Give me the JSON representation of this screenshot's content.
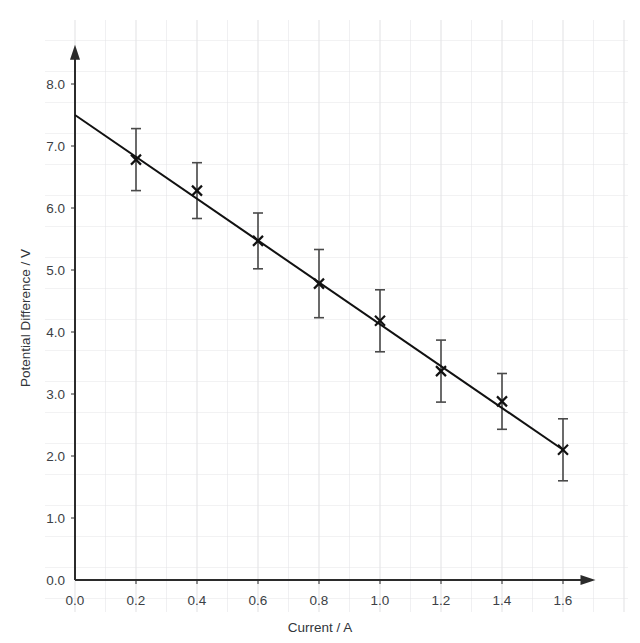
{
  "top_cropped_text": "ed the results of an experiment using a cell",
  "chart_data": {
    "type": "scatter",
    "title": "",
    "subtitle": "",
    "xlabel": "Current / A",
    "ylabel": "Potential Difference / V",
    "xlim": [
      0.0,
      1.7
    ],
    "ylim": [
      0.0,
      8.6
    ],
    "xticks": [
      "0.0",
      "0.2",
      "0.4",
      "0.6",
      "0.8",
      "1.0",
      "1.2",
      "1.4",
      "1.6"
    ],
    "xtick_values": [
      0.0,
      0.2,
      0.4,
      0.6,
      0.8,
      1.0,
      1.2,
      1.4,
      1.6
    ],
    "yticks": [
      "0.0",
      "1.0",
      "2.0",
      "3.0",
      "4.0",
      "5.0",
      "6.0",
      "7.0",
      "8.0"
    ],
    "ytick_values": [
      0.0,
      1.0,
      2.0,
      3.0,
      4.0,
      5.0,
      6.0,
      7.0,
      8.0
    ],
    "grid": true,
    "grid_minor_step_x": 0.1,
    "grid_minor_step_y": 0.5,
    "grid_color": "#e3e3e5",
    "legend": null,
    "marker": "x",
    "marker_color": "#111111",
    "errorbar_color": "#4a4a4a",
    "line_color": "#111111",
    "x": [
      0.2,
      0.4,
      0.6,
      0.8,
      1.0,
      1.2,
      1.4,
      1.6
    ],
    "y": [
      6.78,
      6.28,
      5.47,
      4.78,
      4.18,
      3.37,
      2.88,
      2.1
    ],
    "yerr": [
      0.5,
      0.45,
      0.45,
      0.55,
      0.5,
      0.5,
      0.45,
      0.5
    ],
    "trendline": {
      "x": [
        0.0,
        1.6
      ],
      "y": [
        7.5,
        2.1
      ],
      "intercept": 7.5,
      "slope": -3.375
    },
    "axis_arrows": true
  }
}
